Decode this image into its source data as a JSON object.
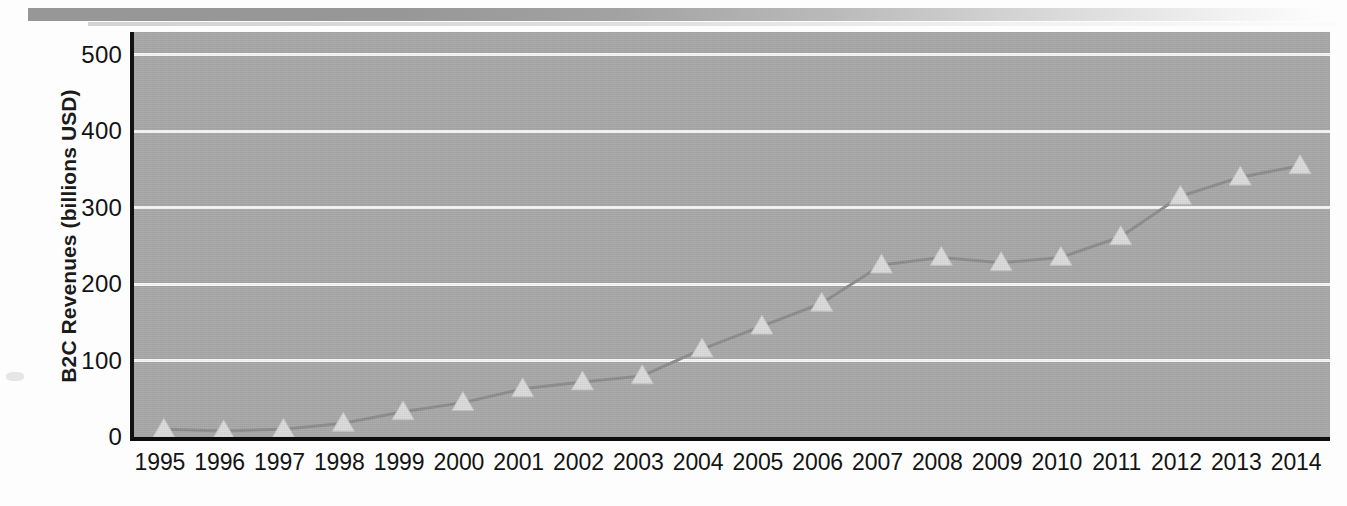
{
  "chart_data": {
    "type": "line",
    "title": "",
    "xlabel": "",
    "ylabel": "B2C Revenues (billions USD)",
    "categories": [
      "1995",
      "1996",
      "1997",
      "1998",
      "1999",
      "2000",
      "2001",
      "2002",
      "2003",
      "2004",
      "2005",
      "2006",
      "2007",
      "2008",
      "2009",
      "2010",
      "2011",
      "2012",
      "2013",
      "2014"
    ],
    "values": [
      10,
      8,
      10,
      18,
      33,
      45,
      63,
      72,
      80,
      115,
      145,
      175,
      225,
      235,
      228,
      235,
      262,
      315,
      340,
      355
    ],
    "series": [
      {
        "name": "B2C Revenues",
        "values": [
          10,
          8,
          10,
          18,
          33,
          45,
          63,
          72,
          80,
          115,
          145,
          175,
          225,
          235,
          228,
          235,
          262,
          315,
          340,
          355
        ]
      }
    ],
    "ylim": [
      0,
      530
    ],
    "yticks": [
      0,
      100,
      200,
      300,
      400,
      500
    ],
    "ytick_labels": [
      "0",
      "100",
      "200",
      "300",
      "400",
      "500"
    ],
    "xlim": [
      "1995",
      "2014"
    ],
    "grid": "horizontal",
    "legend": "none",
    "marker": "triangle",
    "colors": {
      "plot_background": "#a9a9a9",
      "gridline": "#fbfbfb",
      "axis": "#121212",
      "series_line": "#8e8e8e",
      "marker_fill": "#dcdcdc",
      "text": "#131313"
    }
  },
  "axes": {
    "y_title": "B2C Revenues (billions USD)",
    "y_tick_labels": [
      "500",
      "400",
      "300",
      "200",
      "100",
      "0"
    ],
    "x_tick_labels": [
      "1995",
      "1996",
      "1997",
      "1998",
      "1999",
      "2000",
      "2001",
      "2002",
      "2003",
      "2004",
      "2005",
      "2006",
      "2007",
      "2008",
      "2009",
      "2010",
      "2011",
      "2012",
      "2013",
      "2014"
    ]
  }
}
